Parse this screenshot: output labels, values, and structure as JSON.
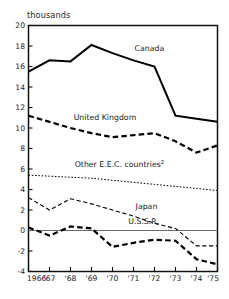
{
  "chart_data": {
    "type": "line",
    "title": "",
    "subtitle": "",
    "unit_label": "thousands",
    "xlabel": "",
    "ylabel": "thousands",
    "x": [
      1966,
      1967,
      1968,
      1969,
      1970,
      1971,
      1972,
      1973,
      1974,
      1975
    ],
    "x_tick_labels": [
      "1966",
      "'67",
      "'68",
      "'69",
      "'70",
      "'71",
      "'72",
      "'73",
      "'74",
      "'75"
    ],
    "y_tick_labels": [
      "20",
      "18",
      "16",
      "14",
      "12",
      "10",
      "8",
      "6",
      "4",
      "2",
      "0",
      "-2",
      "-4"
    ],
    "y_ticks": [
      20,
      18,
      16,
      14,
      12,
      10,
      8,
      6,
      4,
      2,
      0,
      -2,
      -4
    ],
    "ylim": [
      -4,
      20
    ],
    "xlim": [
      1966,
      1975
    ],
    "grid": false,
    "legend_position": "inline-annotations",
    "zero_line": true,
    "series": [
      {
        "name": "Canada",
        "label": "Canada",
        "style": "solid-thick",
        "label_x": 1971.05,
        "label_y": 17.55,
        "values": [
          15.5,
          16.6,
          16.5,
          18.1,
          17.3,
          16.6,
          16.0,
          11.2,
          10.9,
          10.6
        ]
      },
      {
        "name": "United Kingdom",
        "label": "United Kingdom",
        "style": "dashed-thick",
        "label_x": 1968.15,
        "label_y": 10.75,
        "values": [
          11.2,
          10.6,
          10.0,
          9.5,
          9.1,
          9.3,
          9.5,
          8.7,
          7.6,
          8.3
        ]
      },
      {
        "name": "Other E.E.C. countries",
        "label": "Other E.E.C. countries",
        "footnote_marker": "2",
        "style": "dotted-fine",
        "label_x": 1968.2,
        "label_y": 6.15,
        "values": [
          5.4,
          5.3,
          5.2,
          5.1,
          4.9,
          4.7,
          4.5,
          4.3,
          4.1,
          3.9
        ]
      },
      {
        "name": "Japan",
        "label": "Japan",
        "style": "dashed-thin",
        "label_x": 1971.1,
        "label_y": 2.05,
        "values": [
          3.2,
          2.0,
          3.1,
          2.6,
          2.0,
          1.4,
          0.7,
          0.2,
          -1.5,
          -1.5
        ]
      },
      {
        "name": "U.S.S.R.",
        "label": "U.S.S.R.",
        "style": "dashed-thick",
        "label_x": 1970.75,
        "label_y": 0.62,
        "values": [
          0.3,
          -0.5,
          0.4,
          0.2,
          -1.6,
          -1.2,
          -0.9,
          -1.0,
          -2.8,
          -3.3
        ]
      }
    ],
    "colors": {
      "axis": "#111111",
      "series": "#000000",
      "zero_line": "#6b6b6b",
      "background": "#ffffff"
    }
  }
}
